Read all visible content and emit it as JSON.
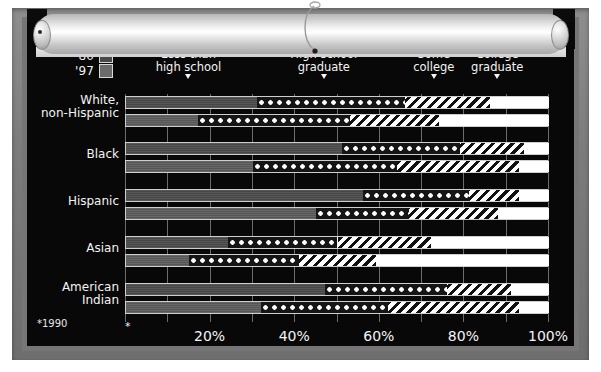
{
  "meta": {
    "footnote": "*1990",
    "axis_star": "*"
  },
  "legend": {
    "items": [
      {
        "label": "'80",
        "swatch_name": "swatch-1980",
        "color": "#4a4a4a"
      },
      {
        "label": "'97",
        "swatch_name": "swatch-1997",
        "color": "#6b6b6b"
      }
    ]
  },
  "chart_data": {
    "type": "bar",
    "orientation": "horizontal",
    "stacked": true,
    "title": "",
    "subtitle": "",
    "xlabel": "",
    "ylabel": "",
    "xlim": [
      0,
      100
    ],
    "xticks": [
      20,
      40,
      60,
      80,
      100
    ],
    "xtick_labels": [
      "20%",
      "40%",
      "60%",
      "80%",
      "100%"
    ],
    "grid": true,
    "grid_interval": 10,
    "legend_position": "top-left",
    "categories": [
      "White, non-Hispanic",
      "Black",
      "Hispanic",
      "Asian",
      "American Indian"
    ],
    "groups": [
      "'80",
      "'97"
    ],
    "segment_labels": [
      "Less than high school",
      "High school graduate",
      "Some college",
      "College graduate"
    ],
    "segment_header_positions": [
      15,
      47,
      73,
      88
    ],
    "series": [
      {
        "name": "Less than high school",
        "style": "solid",
        "values_1980": [
          31,
          51,
          56,
          24,
          47
        ],
        "values_1997": [
          17,
          30,
          45,
          15,
          32
        ]
      },
      {
        "name": "High school graduate",
        "style": "dotted",
        "values_1980": [
          35,
          28,
          25,
          26,
          29
        ],
        "values_1997": [
          36,
          34,
          22,
          26,
          30
        ]
      },
      {
        "name": "Some college",
        "style": "hatched",
        "values_1980": [
          20,
          15,
          12,
          22,
          15
        ],
        "values_1997": [
          21,
          29,
          21,
          18,
          31
        ]
      },
      {
        "name": "College graduate",
        "style": "white",
        "values_1980": [
          14,
          6,
          7,
          28,
          9
        ],
        "values_1997": [
          26,
          7,
          12,
          41,
          7
        ]
      }
    ],
    "cumulative_1980": [
      [
        31,
        66,
        86,
        100
      ],
      [
        51,
        79,
        94,
        100
      ],
      [
        56,
        81,
        93,
        100
      ],
      [
        24,
        50,
        72,
        100
      ],
      [
        47,
        76,
        91,
        100
      ]
    ],
    "cumulative_1997": [
      [
        17,
        53,
        74,
        100
      ],
      [
        30,
        64,
        93,
        100
      ],
      [
        45,
        67,
        88,
        100
      ],
      [
        15,
        41,
        59,
        100
      ],
      [
        32,
        62,
        93,
        100
      ]
    ]
  },
  "colors": {
    "board": "#080808",
    "frame": "#7c7c7c",
    "text": "#f4f4f4",
    "grid": "#6d6d6d",
    "solid_1980": "#4b4b4b",
    "solid_1997": "#5c5c5c"
  }
}
